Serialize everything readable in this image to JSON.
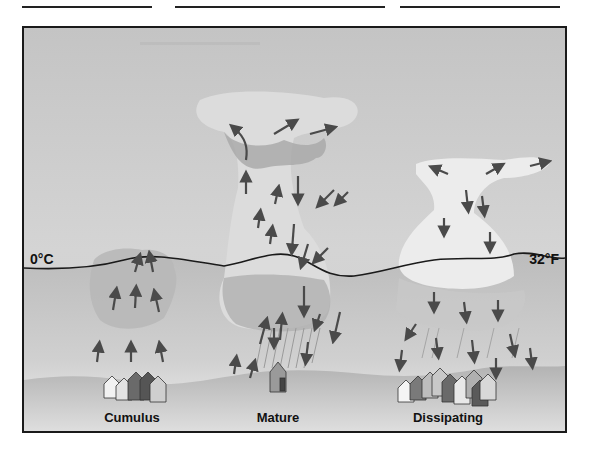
{
  "figure": {
    "title_partial": "(cut off at top edge)",
    "freezing_line": {
      "left_label": "0°C",
      "right_label": "32°F"
    },
    "stages": [
      {
        "label": "Cumulus",
        "motion": "updrafts only"
      },
      {
        "label": "Mature",
        "motion": "updrafts and downdrafts with precipitation"
      },
      {
        "label": "Dissipating",
        "motion": "downdrafts only"
      }
    ],
    "colors": {
      "sky": "#c9c9c9",
      "below_freezing_sky": "#bdbdbd",
      "ground": "#a9a9a9",
      "cloud_light": "#e2e2e2",
      "cloud_dark": "#9e9e9e",
      "arrow": "#4a4a4a",
      "frame": "#1a1a1a"
    }
  }
}
